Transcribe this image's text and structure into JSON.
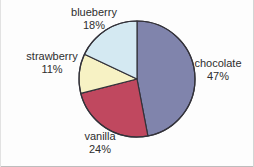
{
  "chart_data": {
    "type": "pie",
    "title": "",
    "subtitle": "",
    "xlabel": "",
    "ylabel": "",
    "legend_position": "none",
    "grid": false,
    "labels_inline": true,
    "units": "percent",
    "start_angle_deg": 0,
    "direction": "clockwise",
    "categories": [
      "chocolate",
      "vanilla",
      "strawberry",
      "blueberry"
    ],
    "values": [
      47,
      24,
      11,
      18
    ],
    "slices": [
      {
        "label": "chocolate",
        "percent_text": "47%",
        "value": 47,
        "color": "#8084ac",
        "start_deg": 0,
        "end_deg": 169.2,
        "label_position": "right"
      },
      {
        "label": "vanilla",
        "percent_text": "24%",
        "value": 24,
        "color": "#c0485f",
        "start_deg": 169.2,
        "end_deg": 255.6,
        "label_position": "bottom"
      },
      {
        "label": "strawberry",
        "percent_text": "11%",
        "value": 11,
        "color": "#f7f2c4",
        "start_deg": 255.6,
        "end_deg": 295.2,
        "label_position": "left"
      },
      {
        "label": "blueberry",
        "percent_text": "18%",
        "value": 18,
        "color": "#d4e9f2",
        "start_deg": 295.2,
        "end_deg": 360,
        "label_position": "top-left"
      }
    ]
  },
  "geometry": {
    "center_x": 137,
    "center_y": 79,
    "radius": 58,
    "outline_color": "#33323a",
    "outline_width": 1.2
  },
  "labels": {
    "chocolate": {
      "name": "chocolate",
      "percent": "47%"
    },
    "vanilla": {
      "name": "vanilla",
      "percent": "24%"
    },
    "strawberry": {
      "name": "strawberry",
      "percent": "11%"
    },
    "blueberry": {
      "name": "blueberry",
      "percent": "18%"
    }
  }
}
